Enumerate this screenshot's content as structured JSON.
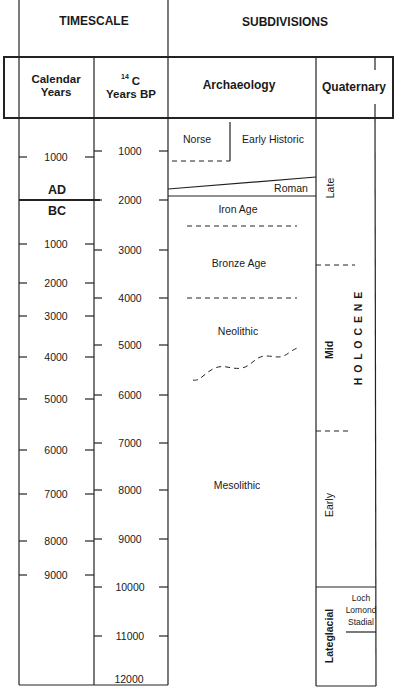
{
  "header": {
    "timescale": "TIMESCALE",
    "subdivisions": "SUBDIVISIONS"
  },
  "columns": {
    "calendar_line1": "Calendar",
    "calendar_line2": "Years",
    "c14_superscript": "14",
    "c14_line1": "C",
    "c14_line2": "Years BP",
    "archaeology": "Archaeology",
    "quaternary": "Quaternary"
  },
  "calendar_scale": {
    "ad_label": "AD",
    "bc_label": "BC",
    "ticks": [
      {
        "label": "1000",
        "y": 157
      },
      {
        "label": "1000",
        "y": 244
      },
      {
        "label": "2000",
        "y": 283
      },
      {
        "label": "3000",
        "y": 316
      },
      {
        "label": "4000",
        "y": 357
      },
      {
        "label": "5000",
        "y": 399
      },
      {
        "label": "6000",
        "y": 450
      },
      {
        "label": "7000",
        "y": 494
      },
      {
        "label": "8000",
        "y": 541
      },
      {
        "label": "9000",
        "y": 575
      }
    ]
  },
  "c14_scale": {
    "ticks": [
      {
        "label": "1000",
        "y": 151
      },
      {
        "label": "2000",
        "y": 200
      },
      {
        "label": "3000",
        "y": 250
      },
      {
        "label": "4000",
        "y": 298
      },
      {
        "label": "5000",
        "y": 345
      },
      {
        "label": "6000",
        "y": 395
      },
      {
        "label": "7000",
        "y": 443
      },
      {
        "label": "8000",
        "y": 490
      },
      {
        "label": "9000",
        "y": 539
      },
      {
        "label": "10000",
        "y": 587
      },
      {
        "label": "11000",
        "y": 636
      },
      {
        "label": "12000",
        "y": 680
      }
    ]
  },
  "archaeology": {
    "norse": "Norse",
    "early_historic": "Early Historic",
    "roman": "Roman",
    "iron_age": "Iron Age",
    "bronze_age": "Bronze Age",
    "neolithic": "Neolithic",
    "mesolithic": "Mesolithic"
  },
  "quaternary": {
    "late": "Late",
    "mid": "Mid",
    "early": "Early",
    "holocene": "H O L O C E N E",
    "lateglacial": "Lateglacial",
    "loch": "Loch",
    "lomond": "Lomond",
    "stadial": "Stadial"
  }
}
